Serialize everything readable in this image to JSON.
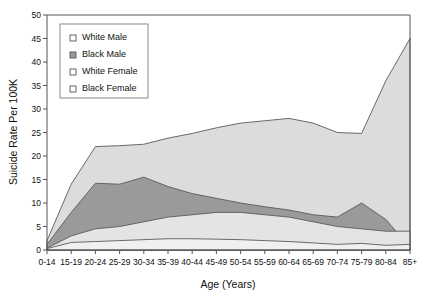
{
  "chart_data": {
    "type": "area",
    "title": "",
    "xlabel": "Age (Years)",
    "ylabel": "Suicide Rate Per 100K",
    "categories": [
      "0-14",
      "15-19",
      "20-24",
      "25-29",
      "30-34",
      "35-39",
      "40-44",
      "45-49",
      "50-54",
      "55-59",
      "60-64",
      "65-69",
      "70-74",
      "75-79",
      "80-84",
      "85+"
    ],
    "xlim_categories": 16,
    "ylim": [
      0,
      50
    ],
    "ytick_step": 5,
    "yticks": [
      0,
      5,
      10,
      15,
      20,
      25,
      30,
      35,
      40,
      45,
      50
    ],
    "grid": false,
    "legend_position": "top-left-inside",
    "stacked": false,
    "series": [
      {
        "name": "White Male",
        "color": "#dcdcdc",
        "swatch": "open-square",
        "values": [
          1.5,
          14.0,
          22.0,
          22.2,
          22.5,
          23.5,
          24.5,
          25.5,
          26.5,
          27.0,
          27.5,
          28.0,
          30.5,
          31.0,
          31.5,
          31.5
        ]
      },
      {
        "name": "Black Male",
        "color": "#9a9a9a",
        "swatch": "filled-square",
        "values": [
          1.2,
          8.0,
          14.2,
          14.0,
          15.5,
          13.5,
          12.0,
          11.0,
          10.0,
          9.2,
          8.5,
          7.5,
          7.0,
          10.0,
          6.5,
          0.5
        ]
      },
      {
        "name": "White Female",
        "color": "#e4e4e4",
        "swatch": "open-square",
        "values": [
          0.4,
          3.0,
          4.5,
          5.0,
          6.0,
          7.0,
          7.5,
          8.0,
          8.0,
          7.5,
          7.0,
          6.0,
          5.0,
          4.5,
          4.0,
          4.0
        ]
      },
      {
        "name": "Black Female",
        "color": "#f0f0f0",
        "swatch": "open-square",
        "values": [
          0.3,
          1.6,
          1.8,
          2.0,
          2.2,
          2.4,
          2.4,
          2.3,
          2.2,
          2.0,
          1.8,
          1.5,
          1.2,
          1.4,
          1.0,
          1.2
        ]
      }
    ],
    "upper_boundary_whitemale": [
      2.0,
      14.0,
      22.0,
      22.2,
      22.5,
      23.8,
      24.8,
      26.0,
      27.0,
      27.5,
      28.0,
      27.0,
      25.0,
      24.8,
      36.0,
      45.0
    ],
    "annotations": []
  },
  "legend": {
    "items": [
      {
        "label": "White Male",
        "swatch": "open-square"
      },
      {
        "label": "Black Male",
        "swatch": "filled-square"
      },
      {
        "label": "White Female",
        "swatch": "open-square"
      },
      {
        "label": "Black Female",
        "swatch": "open-square"
      }
    ]
  },
  "axes": {
    "y_title": "Suicide Rate Per 100K",
    "x_title": "Age (Years)",
    "y_tick_labels": [
      "0",
      "5",
      "10",
      "15",
      "20",
      "25",
      "30",
      "35",
      "40",
      "45",
      "50"
    ],
    "x_tick_labels": [
      "0-14",
      "15-19",
      "20-24",
      "25-29",
      "30-34",
      "35-39",
      "40-44",
      "45-49",
      "50-54",
      "55-59",
      "60-64",
      "65-69",
      "70-74",
      "75-79",
      "80-84",
      "85+"
    ]
  },
  "colors": {
    "white_male": "#dcdcdc",
    "black_male": "#9a9a9a",
    "white_female": "#e4e4e4",
    "black_female": "#f0f0f0",
    "axis": "#555555",
    "text": "#111111"
  }
}
